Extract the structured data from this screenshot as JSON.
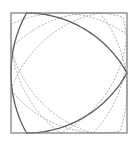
{
  "diagram": {
    "type": "reuleaux-triangle-rotating-in-square",
    "canvas": {
      "width": 137,
      "height": 145
    },
    "square": {
      "x": 11,
      "y": 13,
      "width": 116,
      "height": 120,
      "stroke": "#7a7a7a",
      "stroke_width": 1.2
    },
    "solid_triangle": {
      "rotation_deg": 90,
      "stroke": "#5a5a5a",
      "stroke_width": 1.3
    },
    "dashed_triangles": [
      {
        "rotation_deg": 20,
        "stroke": "#b0b0b0",
        "stroke_width": 1,
        "dash": "2,1.5"
      },
      {
        "rotation_deg": 45,
        "stroke": "#b0b0b0",
        "stroke_width": 1,
        "dash": "2,1.5"
      },
      {
        "rotation_deg": 65,
        "stroke": "#b0b0b0",
        "stroke_width": 1,
        "dash": "2,1.5"
      }
    ]
  }
}
